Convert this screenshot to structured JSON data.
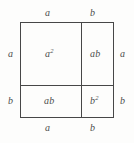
{
  "figure": {
    "background_color": "#fdfdfc",
    "line_color": "#474747",
    "text_color": "#4d4d4d"
  },
  "edge_labels": {
    "top_left": "a",
    "top_right": "b",
    "bottom_left": "a",
    "bottom_right": "b",
    "left_upper": "a",
    "left_lower": "b",
    "right_upper": "a",
    "right_lower": "b"
  },
  "cells": {
    "top_left": {
      "base": "a",
      "exponent": "2"
    },
    "top_right": {
      "base": "ab",
      "exponent": ""
    },
    "bottom_left": {
      "base": "ab",
      "exponent": ""
    },
    "bottom_right": {
      "base": "b",
      "exponent": "2"
    }
  },
  "chart_data": {
    "type": "diagram",
    "square_side_segments": {
      "a": 61,
      "b": 33
    },
    "regions": [
      {
        "position": "top-left",
        "label": "a^2",
        "width": "a",
        "height": "a"
      },
      {
        "position": "top-right",
        "label": "ab",
        "width": "b",
        "height": "a"
      },
      {
        "position": "bottom-left",
        "label": "ab",
        "width": "a",
        "height": "b"
      },
      {
        "position": "bottom-right",
        "label": "b^2",
        "width": "b",
        "height": "b"
      }
    ],
    "grid": true,
    "legend": "none"
  }
}
